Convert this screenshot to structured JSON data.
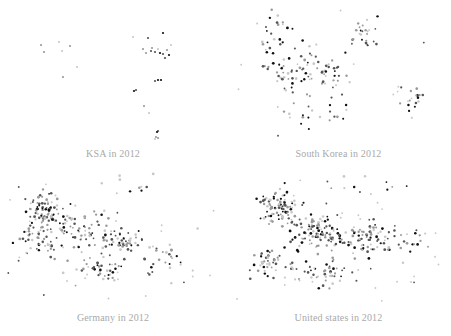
{
  "figure": {
    "background_color": "#ffffff",
    "width": 451,
    "height": 336,
    "layout": "2x2-grid-of-scatter-panels",
    "caption_color": "#a9a9a9"
  },
  "panels": [
    {
      "key": "ksa",
      "caption": "KSA in 2012"
    },
    {
      "key": "southkorea",
      "caption": "South Korea in 2012"
    },
    {
      "key": "germany",
      "caption": "Germany in 2012"
    },
    {
      "key": "unitedstates",
      "caption": "United states in 2012"
    }
  ],
  "chart_data": [
    {
      "type": "scatter",
      "title": "KSA in 2012",
      "xlabel": "",
      "ylabel": "",
      "xlim": [
        0,
        226
      ],
      "ylim": [
        0,
        145
      ],
      "grid": false,
      "axes_visible": false,
      "legend": null,
      "marker": {
        "shape": "circle",
        "size_px": 2.2,
        "colors": [
          "#111111",
          "#555555",
          "#999999",
          "#c8c8c8"
        ]
      },
      "n_points": 34,
      "point_count_rank": 1,
      "density": "very-sparse",
      "clusters": [
        {
          "name": "west-small",
          "center": [
            46,
            50
          ],
          "spread": [
            12,
            12
          ],
          "n": 5
        },
        {
          "name": "north-east-dense",
          "center": [
            155,
            40
          ],
          "spread": [
            18,
            16
          ],
          "n": 16
        },
        {
          "name": "mid-scatter",
          "center": [
            135,
            88
          ],
          "spread": [
            22,
            18
          ],
          "n": 7
        },
        {
          "name": "south-tail",
          "center": [
            157,
            128
          ],
          "spread": [
            6,
            8
          ],
          "n": 6
        }
      ],
      "points": [
        [
          41,
          45,
          "#999999"
        ],
        [
          59,
          42,
          "#c8c8c8"
        ],
        [
          70,
          46,
          "#999999"
        ],
        [
          44,
          52,
          "#999999"
        ],
        [
          62,
          51,
          "#c8c8c8"
        ],
        [
          77,
          67,
          "#c8c8c8"
        ],
        [
          63,
          77,
          "#999999"
        ],
        [
          133,
          37,
          "#c8c8c8"
        ],
        [
          148,
          38,
          "#555555"
        ],
        [
          163,
          33,
          "#111111"
        ],
        [
          152,
          48,
          "#999999"
        ],
        [
          167,
          50,
          "#999999"
        ],
        [
          151,
          51,
          "#555555"
        ],
        [
          155,
          52,
          "#555555"
        ],
        [
          160,
          53,
          "#111111"
        ],
        [
          163,
          54,
          "#555555"
        ],
        [
          169,
          55,
          "#111111"
        ],
        [
          146,
          53,
          "#999999"
        ],
        [
          158,
          49,
          "#c8c8c8"
        ],
        [
          171,
          45,
          "#c8c8c8"
        ],
        [
          143,
          49,
          "#999999"
        ],
        [
          165,
          58,
          "#555555"
        ],
        [
          158,
          80,
          "#111111"
        ],
        [
          161,
          80,
          "#111111"
        ],
        [
          155,
          81,
          "#555555"
        ],
        [
          136,
          90,
          "#555555"
        ],
        [
          134,
          91,
          "#111111"
        ],
        [
          144,
          106,
          "#999999"
        ],
        [
          149,
          113,
          "#c8c8c8"
        ],
        [
          158,
          131,
          "#555555"
        ],
        [
          157,
          132,
          "#111111"
        ],
        [
          156,
          137,
          "#999999"
        ],
        [
          158,
          138,
          "#999999"
        ],
        [
          155,
          139,
          "#c8c8c8"
        ]
      ]
    },
    {
      "type": "scatter",
      "title": "South Korea in 2012",
      "xlabel": "",
      "ylabel": "",
      "xlim": [
        0,
        225
      ],
      "ylim": [
        0,
        145
      ],
      "grid": false,
      "axes_visible": false,
      "legend": null,
      "marker": {
        "shape": "circle",
        "size_px": 2.2,
        "colors": [
          "#111111",
          "#555555",
          "#999999",
          "#c8c8c8"
        ]
      },
      "n_points": 175,
      "point_count_rank": 2,
      "density": "moderate",
      "clusters": [
        {
          "name": "north-chain",
          "center": [
            50,
            35
          ],
          "spread": [
            14,
            18
          ],
          "n": 22
        },
        {
          "name": "central-mass",
          "center": [
            72,
            70
          ],
          "spread": [
            26,
            22
          ],
          "n": 58
        },
        {
          "name": "mid-right-band",
          "center": [
            105,
            70
          ],
          "spread": [
            22,
            16
          ],
          "n": 30
        },
        {
          "name": "north-east-group",
          "center": [
            140,
            35
          ],
          "spread": [
            14,
            16
          ],
          "n": 25
        },
        {
          "name": "east-outlier-group",
          "center": [
            185,
            100
          ],
          "spread": [
            12,
            12
          ],
          "n": 20
        },
        {
          "name": "south-scatter",
          "center": [
            90,
            115
          ],
          "spread": [
            30,
            14
          ],
          "n": 20
        }
      ]
    },
    {
      "type": "scatter",
      "title": "Germany in 2012",
      "xlabel": "",
      "ylabel": "",
      "xlim": [
        0,
        226
      ],
      "ylim": [
        0,
        142
      ],
      "grid": false,
      "axes_visible": false,
      "legend": null,
      "marker": {
        "shape": "circle",
        "size_px": 2.2,
        "colors": [
          "#111111",
          "#555555",
          "#999999",
          "#c8c8c8"
        ]
      },
      "n_points": 330,
      "point_count_rank": 3,
      "density": "dense",
      "clusters": [
        {
          "name": "north-west-core",
          "center": [
            45,
            45
          ],
          "spread": [
            18,
            16
          ],
          "n": 95
        },
        {
          "name": "west-lower",
          "center": [
            40,
            75
          ],
          "spread": [
            16,
            14
          ],
          "n": 45
        },
        {
          "name": "central-band",
          "center": [
            85,
            62
          ],
          "spread": [
            22,
            16
          ],
          "n": 60
        },
        {
          "name": "center-right-knot",
          "center": [
            122,
            75
          ],
          "spread": [
            16,
            12
          ],
          "n": 50
        },
        {
          "name": "south-band",
          "center": [
            100,
            100
          ],
          "spread": [
            30,
            12
          ],
          "n": 45
        },
        {
          "name": "east-tail",
          "center": [
            170,
            90
          ],
          "spread": [
            22,
            16
          ],
          "n": 25
        },
        {
          "name": "far-outliers",
          "center": [
            140,
            20
          ],
          "spread": [
            30,
            10
          ],
          "n": 10
        }
      ]
    },
    {
      "type": "scatter",
      "title": "United states in 2012",
      "xlabel": "",
      "ylabel": "",
      "xlim": [
        0,
        225
      ],
      "ylim": [
        0,
        142
      ],
      "grid": false,
      "axes_visible": false,
      "legend": null,
      "marker": {
        "shape": "circle",
        "size_px": 2.2,
        "colors": [
          "#111111",
          "#555555",
          "#999999",
          "#c8c8c8"
        ]
      },
      "n_points": 380,
      "point_count_rank": 4,
      "density": "very-dense",
      "clusters": [
        {
          "name": "north-west-core",
          "center": [
            55,
            40
          ],
          "spread": [
            18,
            15
          ],
          "n": 90
        },
        {
          "name": "central-core",
          "center": [
            95,
            65
          ],
          "spread": [
            24,
            16
          ],
          "n": 105
        },
        {
          "name": "center-right-knot",
          "center": [
            140,
            72
          ],
          "spread": [
            18,
            12
          ],
          "n": 75
        },
        {
          "name": "west-lower",
          "center": [
            45,
            95
          ],
          "spread": [
            18,
            14
          ],
          "n": 45
        },
        {
          "name": "south-band",
          "center": [
            100,
            105
          ],
          "spread": [
            30,
            14
          ],
          "n": 50
        },
        {
          "name": "east-tail",
          "center": [
            180,
            75
          ],
          "spread": [
            18,
            20
          ],
          "n": 20
        },
        {
          "name": "far-outliers",
          "center": [
            140,
            18
          ],
          "spread": [
            40,
            12
          ],
          "n": 12
        }
      ]
    }
  ]
}
